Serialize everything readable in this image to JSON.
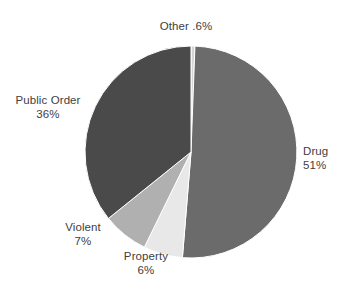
{
  "chart_data": {
    "type": "pie",
    "title": "",
    "subtitle": "",
    "xlabel": "",
    "ylabel": "",
    "legend_position": "none",
    "grid": false,
    "start_angle_deg": 0,
    "direction": "clockwise",
    "categories": [
      "Other",
      "Drug",
      "Property",
      "Violent",
      "Public Order"
    ],
    "values": [
      0.6,
      51,
      6,
      7,
      36
    ],
    "slices": [
      {
        "name": "Other",
        "value": 0.6,
        "value_text": ".6%",
        "label_text": "Other .6%",
        "color": "#d5d5d5",
        "label_layout": "inline"
      },
      {
        "name": "Drug",
        "value": 51,
        "value_text": "51%",
        "label_text": "Drug",
        "color": "#6b6b6b",
        "label_layout": "stacked"
      },
      {
        "name": "Property",
        "value": 6,
        "value_text": "6%",
        "label_text": "Property",
        "color": "#e8e8e8",
        "label_layout": "stacked"
      },
      {
        "name": "Violent",
        "value": 7,
        "value_text": "7%",
        "label_text": "Violent",
        "color": "#b0b0b0",
        "label_layout": "stacked"
      },
      {
        "name": "Public Order",
        "value": 36,
        "value_text": "36%",
        "label_text": "Public Order",
        "color": "#4a4a4a",
        "label_layout": "stacked"
      }
    ],
    "geometry": {
      "center_x": 191,
      "center_y": 152,
      "radius": 106
    }
  },
  "labels": {
    "other": {
      "name": "Other",
      "value": ".6%"
    },
    "drug": {
      "name": "Drug",
      "value": "51%"
    },
    "property": {
      "name": "Property",
      "value": "6%"
    },
    "violent": {
      "name": "Violent",
      "value": "7%"
    },
    "public_order": {
      "name": "Public Order",
      "value": "36%"
    }
  },
  "colors": {
    "background": "#ffffff",
    "text": "#414141",
    "slice_other": "#d5d5d5",
    "slice_drug": "#6b6b6b",
    "slice_property": "#e8e8e8",
    "slice_violent": "#b0b0b0",
    "slice_public_order": "#4a4a4a"
  }
}
